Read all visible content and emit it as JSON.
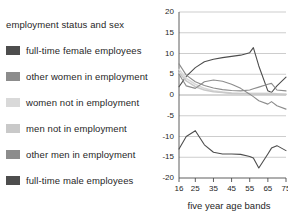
{
  "legend": {
    "title": "employment status and sex",
    "items": [
      {
        "label": "full-time female employees",
        "color": "#4d4d4d"
      },
      {
        "label": "other women in employment",
        "color": "#8c8c8c"
      },
      {
        "label": "women not in employment",
        "color": "#d9d9d9"
      },
      {
        "label": "men not in employment",
        "color": "#c9c9c9"
      },
      {
        "label": "other men in employment",
        "color": "#8c8c8c"
      },
      {
        "label": "full-time male employees",
        "color": "#4d4d4d"
      }
    ]
  },
  "chart_data": {
    "type": "line",
    "title": "",
    "xlabel": "five year age bands",
    "ylabel": "",
    "xlim": [
      16,
      75
    ],
    "ylim": [
      -20,
      20
    ],
    "grid": true,
    "legend_position": "left",
    "xticks": [
      16,
      25,
      35,
      45,
      55,
      65,
      75
    ],
    "yticks": [
      -20,
      -15,
      -10,
      -5,
      0,
      5,
      10,
      15,
      20
    ],
    "x": [
      16,
      20,
      25,
      30,
      35,
      40,
      45,
      50,
      55,
      57,
      60,
      65,
      67,
      70,
      75
    ],
    "series": [
      {
        "name": "full-time female employees",
        "color": "#4d4d4d",
        "values": [
          2.0,
          4.5,
          6.6,
          8.0,
          8.6,
          9.0,
          9.3,
          9.6,
          10.2,
          11.4,
          7.0,
          1.0,
          0.6,
          2.2,
          4.3
        ]
      },
      {
        "name": "other women in employment",
        "color": "#8c8c8c",
        "values": [
          7.5,
          4.8,
          3.2,
          2.3,
          1.7,
          1.3,
          1.1,
          1.0,
          1.2,
          1.5,
          1.9,
          2.6,
          2.8,
          1.2,
          1.0
        ]
      },
      {
        "name": "women not in employment",
        "color": "#d9d9d9",
        "values": [
          6.2,
          4.0,
          2.6,
          1.6,
          1.0,
          0.7,
          0.5,
          0.4,
          0.4,
          0.4,
          0.4,
          0.4,
          0.4,
          0.3,
          0.2
        ]
      },
      {
        "name": "men not in employment",
        "color": "#c9c9c9",
        "values": [
          5.4,
          3.4,
          2.0,
          1.2,
          0.8,
          0.6,
          0.4,
          0.3,
          0.3,
          0.2,
          0.2,
          0.2,
          0.2,
          0.2,
          0.1
        ]
      },
      {
        "name": "other men in employment",
        "color": "#8c8c8c",
        "values": [
          5.0,
          2.2,
          1.6,
          3.2,
          3.6,
          3.3,
          2.6,
          1.6,
          0.2,
          -0.4,
          -1.4,
          -2.2,
          -1.6,
          -2.6,
          -3.4
        ]
      },
      {
        "name": "full-time male employees",
        "color": "#4d4d4d",
        "values": [
          -13.0,
          -10.0,
          -8.6,
          -12.0,
          -13.8,
          -14.2,
          -14.2,
          -14.3,
          -14.8,
          -15.2,
          -17.6,
          -14.2,
          -12.8,
          -12.2,
          -13.4
        ]
      }
    ]
  }
}
